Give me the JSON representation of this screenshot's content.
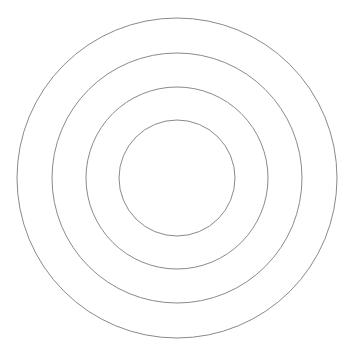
{
  "diagram": {
    "type": "concentric-circles",
    "width": 355,
    "height": 361,
    "background": "#ffffff",
    "center": {
      "cx": 177,
      "cy": 178
    },
    "stroke_color": "#8a8a8a",
    "stroke_width": 1,
    "circles": [
      {
        "name": "outer-ring",
        "r": 160
      },
      {
        "name": "second-ring",
        "r": 125
      },
      {
        "name": "third-ring",
        "r": 91
      },
      {
        "name": "inner-ring",
        "r": 58
      }
    ]
  }
}
